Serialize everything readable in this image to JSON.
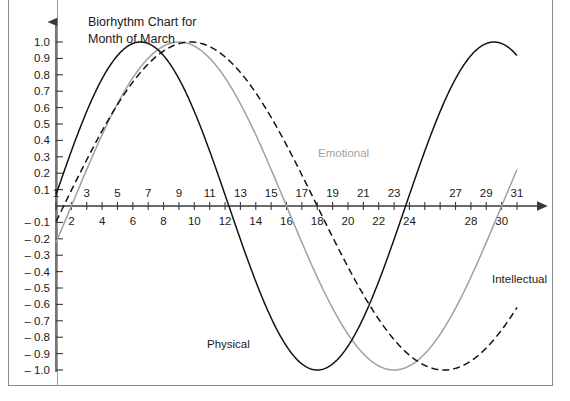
{
  "chart_data": {
    "type": "line",
    "title": "Biorhythm Chart for Month of March",
    "title_line1": "Biorhythm Chart for",
    "title_line2": "Month of March",
    "xlabel": "",
    "ylabel": "",
    "xlim": [
      0.2,
      31.8
    ],
    "ylim": [
      -1.05,
      1.08
    ],
    "grid": false,
    "legend_position": "inline-annotations",
    "x_tick_labels_odd": [
      "1",
      "3",
      "5",
      "7",
      "9",
      "11",
      "13",
      "15",
      "17",
      "19",
      "21",
      "23",
      "27",
      "29",
      "31"
    ],
    "x_tick_values_odd": [
      1,
      3,
      5,
      7,
      9,
      11,
      13,
      15,
      17,
      19,
      21,
      23,
      27,
      29,
      31
    ],
    "x_tick_labels_even": [
      "2",
      "4",
      "6",
      "8",
      "10",
      "12",
      "14",
      "16",
      "18",
      "20",
      "22",
      "24",
      "28",
      "30"
    ],
    "x_tick_values_even": [
      2,
      4,
      6,
      8,
      10,
      12,
      14,
      16,
      18,
      20,
      22,
      24,
      28,
      30
    ],
    "y_tick_labels": [
      "1.0",
      "0.9",
      "0.8",
      "0.7",
      "0.6",
      "0.5",
      "0.4",
      "0.3",
      "0.2",
      "0.1",
      "– 0.1",
      "– 0.2",
      "– 0.3",
      "– 0.4",
      "– 0.5",
      "– 0.6",
      "– 0.7",
      "– 0.8",
      "– 0.9",
      "– 1.0"
    ],
    "y_tick_values": [
      1.0,
      0.9,
      0.8,
      0.7,
      0.6,
      0.5,
      0.4,
      0.3,
      0.2,
      0.1,
      -0.1,
      -0.2,
      -0.3,
      -0.4,
      -0.5,
      -0.6,
      -0.7,
      -0.8,
      -0.9,
      -1.0
    ],
    "series": [
      {
        "name": "Physical",
        "label": "Physical",
        "color": "#141414",
        "style": "solid",
        "cycle_days": 23,
        "phase_day": 0.75,
        "x": [
          1,
          2,
          3,
          4,
          5,
          6,
          7,
          8,
          9,
          10,
          11,
          12,
          13,
          14,
          15,
          16,
          17,
          18,
          19,
          20,
          21,
          22,
          23,
          24,
          25,
          26,
          27,
          28,
          29,
          30,
          31
        ],
        "values": [
          0.07,
          -0.2,
          -0.46,
          -0.68,
          -0.85,
          -0.96,
          -1.0,
          -0.97,
          -0.87,
          -0.71,
          -0.5,
          -0.26,
          0.0,
          0.26,
          0.5,
          0.71,
          0.87,
          0.97,
          1.0,
          0.96,
          0.85,
          0.68,
          0.46,
          0.2,
          -0.07,
          -0.33,
          -0.57,
          -0.77,
          -0.91,
          -0.99,
          -1.0
        ]
      },
      {
        "name": "Emotional",
        "label": "Emotional",
        "color": "#a0a0a0",
        "style": "solid",
        "cycle_days": 28,
        "phase_day": 2.0,
        "x": [
          1,
          2,
          3,
          4,
          5,
          6,
          7,
          8,
          9,
          10,
          11,
          12,
          13,
          14,
          15,
          16,
          17,
          18,
          19,
          20,
          21,
          22,
          23,
          24,
          25,
          26,
          27,
          28,
          29,
          30,
          31
        ],
        "values": [
          -1.0,
          -0.97,
          -0.9,
          -0.78,
          -0.62,
          -0.43,
          -0.22,
          0.0,
          0.22,
          0.43,
          0.62,
          0.78,
          0.9,
          0.97,
          1.0,
          0.97,
          0.9,
          0.78,
          0.62,
          0.43,
          0.22,
          0.0,
          -0.22,
          -0.43,
          -0.62,
          -0.78,
          -0.9,
          -0.97,
          -1.0,
          -0.97,
          -0.9
        ]
      },
      {
        "name": "Intellectual",
        "label": "Intellectual",
        "color": "#141414",
        "style": "dashed",
        "cycle_days": 33,
        "phase_day": 1.5,
        "x": [
          1,
          2,
          3,
          4,
          5,
          6,
          7,
          8,
          9,
          10,
          11,
          12,
          13,
          14,
          15,
          16,
          17,
          18,
          19,
          20,
          21,
          22,
          23,
          24,
          25,
          26,
          27,
          28,
          29,
          30,
          31
        ],
        "values": [
          -0.99,
          -0.95,
          -0.86,
          -0.73,
          -0.57,
          -0.38,
          -0.17,
          0.05,
          0.27,
          0.47,
          0.65,
          0.8,
          0.91,
          0.98,
          1.0,
          0.98,
          0.91,
          0.8,
          0.65,
          0.47,
          0.27,
          0.05,
          -0.17,
          -0.38,
          -0.57,
          -0.73,
          -0.86,
          -0.95,
          -0.99,
          -1.0,
          -0.96
        ]
      }
    ],
    "annotations": [
      {
        "text": "Physical",
        "x_px": 207,
        "y_px": 348
      },
      {
        "text": "Emotional",
        "x_px": 318,
        "y_px": 157
      },
      {
        "text": "Intellectual",
        "x_px": 492,
        "y_px": 283
      }
    ]
  }
}
